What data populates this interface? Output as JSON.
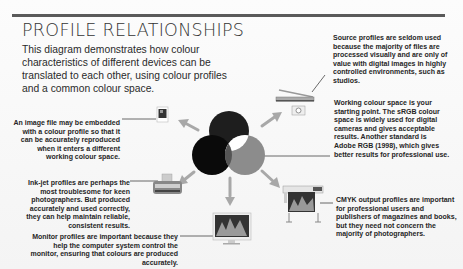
{
  "title": "PROFILE RELATIONSHIPS",
  "intro": "This diagram demonstrates how colour characteristics of different devices can be translated to each other, using colour profiles and a common colour space.",
  "notes": {
    "source": "Source profiles are seldom used because the majority of files are processed visually and are only of value with digital images in highly controlled environments, such as studios.",
    "embedded": "An image file may be embedded with a colour profile so that it can be accurately reproduced when it enters a different working colour space.",
    "working": "Working colour space is your starting point. The sRGB colour space is widely used for digital cameras and gives acceptable results. Another standard is Adobe RGB (1998), which gives better results for professional use.",
    "inkjet": "Ink-jet profiles are perhaps the most troublesome for keen photographers. But produced accurately and used correctly, they can help maintain reliable, consistent results.",
    "cmyk": "CMYK output profiles are important for professional users and publishers of magazines and books, but they need not concern the majority of photographers.",
    "monitor": "Monitor profiles are important because they help the computer system control the monitor, ensuring that colours are produced accurately."
  },
  "devices": {
    "image_file": "image-file-icon",
    "scanner": "scanner-icon",
    "camera": "camera-icon",
    "inkjet": "inkjet-printer-icon",
    "monitor": "monitor-icon",
    "large_printer": "large-format-printer-icon"
  },
  "colors": {
    "rule": "#5a5a5a",
    "circle_top": "#1e1e1e",
    "circle_left": "#0a0a0a",
    "circle_right": "#8c8c8c",
    "arrow": "#a8a8a8"
  }
}
